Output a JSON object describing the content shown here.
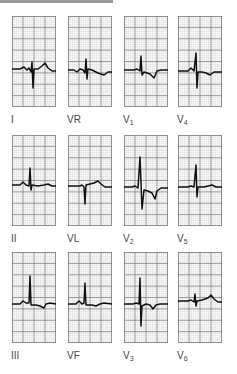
{
  "figure": {
    "grid": {
      "minor_color": "#cfcfcf",
      "major_color": "#7a7a7a",
      "trace_color": "#111111"
    },
    "leads": [
      {
        "id": "I",
        "label": "I",
        "sub": "",
        "col": 0,
        "row": 0,
        "path": "M0,53 L8,53 L12,51 L15,54 L17,52 L19,56 L20,46 L21,72 L22,53 L26,53 L30,50 L33,47 L36,52 L40,55 L44,55"
      },
      {
        "id": "VR",
        "label": "VR",
        "sub": "",
        "col": 1,
        "row": 0,
        "path": "M0,54 L6,54 L9,56 L12,53 L15,54 L17,57 L18,43 L19,63 L20,53 L24,54 L30,57 L36,59 L40,56 L44,56"
      },
      {
        "id": "V1",
        "label": "V",
        "sub": "1",
        "col": 2,
        "row": 0,
        "path": "M0,54 L10,54 L13,53 L16,55 L17,40 L18,59 L20,56 L26,58 L30,62 L33,55 L37,54 L44,54"
      },
      {
        "id": "V4",
        "label": "V",
        "sub": "4",
        "col": 3,
        "row": 0,
        "path": "M0,55 L10,55 L13,52 L16,55 L18,37 L19,72 L20,56 L24,56 L28,57 L32,59 L36,56 L44,56"
      },
      {
        "id": "II",
        "label": "II",
        "sub": "",
        "col": 0,
        "row": 1,
        "path": "M0,50 L8,50 L11,47 L14,50 L17,51 L18,33 L19,55 L20,50 L26,51 L32,50 L36,49 L40,51 L44,51"
      },
      {
        "id": "VL",
        "label": "VL",
        "sub": "",
        "col": 1,
        "row": 1,
        "path": "M0,51 L12,51 L14,50 L16,52 L17,69 L18,50 L22,49 L26,48 L30,46 L33,49 L37,52 L44,52"
      },
      {
        "id": "V2",
        "label": "V",
        "sub": "2",
        "col": 2,
        "row": 1,
        "path": "M0,52 L8,52 L11,51 L14,53 L16,22 L18,74 L20,55 L24,56 L28,58 L31,64 L33,56 L37,53 L44,53"
      },
      {
        "id": "V5",
        "label": "V",
        "sub": "5",
        "col": 3,
        "row": 1,
        "path": "M0,52 L10,52 L13,51 L16,52 L18,30 L19,62 L20,52 L26,52 L30,51 L34,50 L38,52 L44,52"
      },
      {
        "id": "III",
        "label": "III",
        "sub": "",
        "col": 0,
        "row": 2,
        "path": "M0,52 L8,52 L11,49 L14,51 L17,51 L18,24 L19,53 L24,53 L28,54 L32,56 L34,52 L38,51 L44,52"
      },
      {
        "id": "VF",
        "label": "VF",
        "sub": "",
        "col": 1,
        "row": 2,
        "path": "M0,52 L8,52 L11,49 L14,52 L16,51 L17,31 L18,53 L24,53 L28,54 L32,52 L36,51 L44,52"
      },
      {
        "id": "V3",
        "label": "V",
        "sub": "3",
        "col": 2,
        "row": 2,
        "path": "M0,52 L9,52 L12,51 L15,52 L16,26 L17,74 L18,54 L22,52 L26,53 L29,57 L32,53 L36,52 L44,52"
      },
      {
        "id": "V6",
        "label": "V",
        "sub": "6",
        "col": 3,
        "row": 2,
        "path": "M0,49 L10,49 L13,48 L16,50 L17,42 L18,54 L19,49 L24,48 L30,46 L33,43 L36,47 L40,50 L44,50"
      }
    ]
  },
  "layout": {
    "col_x": [
      12,
      68,
      124,
      178
    ],
    "row_y": [
      16,
      135,
      252
    ],
    "label_dy": 99
  }
}
